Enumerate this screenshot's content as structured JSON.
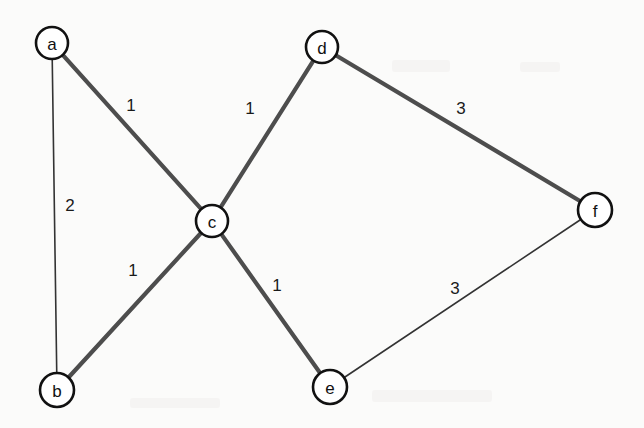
{
  "diagram": {
    "canvas": {
      "width": 644,
      "height": 428,
      "background": "#fbfbfa"
    },
    "style": {
      "node_fill": "#ffffff",
      "node_stroke": "#111111",
      "edge_thick_color": "#4d4d4d",
      "edge_thin_color": "#333333"
    },
    "nodes": [
      {
        "id": "a",
        "label": "a",
        "cx": 52,
        "cy": 43,
        "r": 16
      },
      {
        "id": "b",
        "label": "b",
        "cx": 57,
        "cy": 390,
        "r": 17
      },
      {
        "id": "c",
        "label": "c",
        "cx": 212,
        "cy": 221,
        "r": 16
      },
      {
        "id": "d",
        "label": "d",
        "cx": 322,
        "cy": 47,
        "r": 16
      },
      {
        "id": "e",
        "label": "e",
        "cx": 330,
        "cy": 387,
        "r": 17
      },
      {
        "id": "f",
        "label": "f",
        "cx": 595,
        "cy": 210,
        "r": 17
      }
    ],
    "edges": [
      {
        "id": "a-c",
        "from": "a",
        "to": "c",
        "weight": "1",
        "emphasis": "thick",
        "label_x": 131,
        "label_y": 105
      },
      {
        "id": "a-b",
        "from": "a",
        "to": "b",
        "weight": "2",
        "emphasis": "thin",
        "label_x": 70,
        "label_y": 205
      },
      {
        "id": "b-c",
        "from": "b",
        "to": "c",
        "weight": "1",
        "emphasis": "thick",
        "label_x": 133,
        "label_y": 270
      },
      {
        "id": "c-d",
        "from": "c",
        "to": "d",
        "weight": "1",
        "emphasis": "thick",
        "label_x": 250,
        "label_y": 108
      },
      {
        "id": "c-e",
        "from": "c",
        "to": "e",
        "weight": "1",
        "emphasis": "thick",
        "label_x": 277,
        "label_y": 285
      },
      {
        "id": "d-f",
        "from": "d",
        "to": "f",
        "weight": "3",
        "emphasis": "thick",
        "label_x": 461,
        "label_y": 108
      },
      {
        "id": "e-f",
        "from": "e",
        "to": "f",
        "weight": "3",
        "emphasis": "thin",
        "label_x": 455,
        "label_y": 288
      }
    ]
  }
}
